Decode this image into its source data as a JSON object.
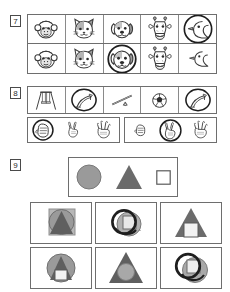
{
  "worksheet": {
    "title": "Visual discrimination worksheet",
    "colors": {
      "frame_border": "#6e6e6e",
      "cell_border": "#8a8a8a",
      "ink": "#3a3a3a",
      "circle_fill": "#9a9a9a",
      "triangle_fill": "#6b6b6b",
      "square_fill": "#ffffff",
      "mark_stroke": "#1e1e1e"
    }
  },
  "questions": [
    {
      "number": "7",
      "label": "Question 7",
      "type": "match-the-picture",
      "rows": [
        {
          "name": "sample-row",
          "items": [
            {
              "icon": "monkey-face-icon",
              "label": "monkey",
              "circled": false
            },
            {
              "icon": "cat-face-icon",
              "label": "cat",
              "circled": false
            },
            {
              "icon": "dog-face-icon",
              "label": "dog",
              "circled": false
            },
            {
              "icon": "giraffe-face-icon",
              "label": "giraffe",
              "circled": false
            },
            {
              "icon": "goose-icon",
              "label": "goose",
              "circled": true
            }
          ]
        },
        {
          "name": "answer-row",
          "items": [
            {
              "icon": "monkey-face-icon",
              "label": "monkey",
              "circled": false
            },
            {
              "icon": "cat-face-icon",
              "label": "cat",
              "circled": false
            },
            {
              "icon": "dog-face-icon",
              "label": "dog",
              "circled": true
            },
            {
              "icon": "giraffe-face-icon",
              "label": "giraffe",
              "circled": false
            },
            {
              "icon": "goose-icon",
              "label": "goose",
              "circled": false
            }
          ]
        }
      ]
    },
    {
      "number": "8",
      "label": "Question 8",
      "type": "match-the-picture",
      "rows": [
        {
          "name": "playground-row",
          "items": [
            {
              "icon": "swing-set-icon",
              "label": "swing set",
              "circled": false
            },
            {
              "icon": "slide-icon",
              "label": "slide",
              "circled": true
            },
            {
              "icon": "seesaw-icon",
              "label": "seesaw",
              "circled": false
            },
            {
              "icon": "soccer-ball-icon",
              "label": "soccer ball",
              "circled": false
            },
            {
              "icon": "slide-icon",
              "label": "slide",
              "circled": true
            }
          ]
        }
      ],
      "hand_groups": [
        {
          "name": "hand-group-left",
          "items": [
            {
              "icon": "fist-hand-icon",
              "label": "fist",
              "circled": true
            },
            {
              "icon": "two-fingers-hand-icon",
              "label": "two fingers",
              "circled": false
            },
            {
              "icon": "open-hand-icon",
              "label": "open hand",
              "circled": false
            }
          ]
        },
        {
          "name": "hand-group-right",
          "items": [
            {
              "icon": "fist-hand-icon",
              "label": "fist",
              "circled": false
            },
            {
              "icon": "two-fingers-hand-icon",
              "label": "two fingers",
              "circled": true
            },
            {
              "icon": "open-hand-icon",
              "label": "open hand",
              "circled": false
            }
          ]
        }
      ]
    },
    {
      "number": "9",
      "label": "Question 9",
      "type": "shape-combination",
      "prompt": {
        "name": "shape-prompt",
        "shapes": [
          {
            "shape": "circle-shape",
            "label": "circle",
            "fill": "#9a9a9a"
          },
          {
            "shape": "triangle-shape",
            "label": "triangle",
            "fill": "#6b6b6b"
          },
          {
            "shape": "square-shape",
            "label": "square",
            "fill": "#ffffff"
          }
        ]
      },
      "options": [
        {
          "name": "option-1",
          "label": "circle, triangle and square overlapping, square behind",
          "marked": false
        },
        {
          "name": "option-2",
          "label": "circle and triangle offset with scribble mark",
          "marked": true
        },
        {
          "name": "option-3",
          "label": "triangle with square inside, no circle",
          "marked": false
        },
        {
          "name": "option-4",
          "label": "circle with triangle and square inside",
          "marked": false
        },
        {
          "name": "option-5",
          "label": "triangle with circle inside, no square",
          "marked": false
        },
        {
          "name": "option-6",
          "label": "two offset circles with square, scribble mark",
          "marked": true
        }
      ]
    }
  ]
}
